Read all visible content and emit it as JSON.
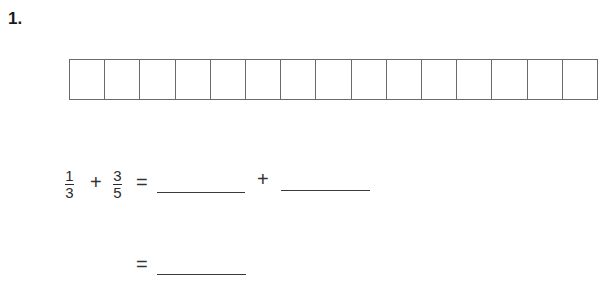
{
  "question": {
    "number_label": "1.",
    "strip": {
      "cell_count": 15
    },
    "equation_line1": {
      "fraction_a": {
        "numerator": "1",
        "denominator": "3"
      },
      "plus_1": "+",
      "fraction_b": {
        "numerator": "3",
        "denominator": "5"
      },
      "equals": "=",
      "blank_1": "",
      "plus_2": "+",
      "blank_2": ""
    },
    "equation_line2": {
      "equals": "=",
      "blank_3": ""
    }
  }
}
